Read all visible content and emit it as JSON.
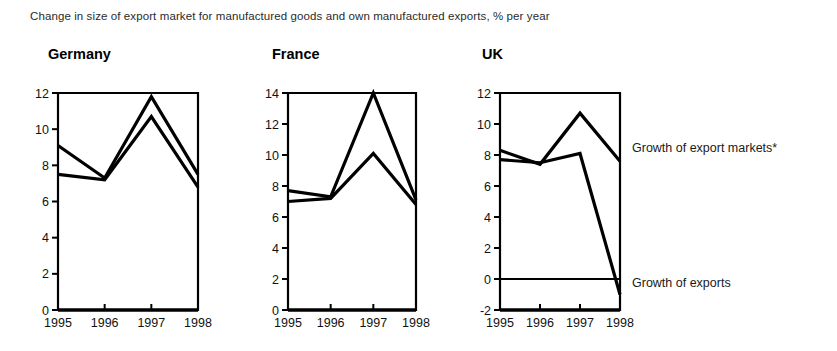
{
  "caption": "Change in size of export market for manufactured goods and own manufactured exports, % per year",
  "legend": {
    "markets": "Growth of export markets*",
    "exports": "Growth of exports"
  },
  "chart_data": [
    {
      "type": "line",
      "title": "Germany",
      "xlabel": "",
      "ylabel": "",
      "x": [
        "1995",
        "1996",
        "1997",
        "1998"
      ],
      "categories": [
        "1995",
        "1996",
        "1997",
        "1998"
      ],
      "ylim": [
        0,
        12
      ],
      "yticks": [
        "0",
        "2",
        "4",
        "6",
        "8",
        "10",
        "12"
      ],
      "ytick_values": [
        0,
        2,
        4,
        6,
        8,
        10,
        12
      ],
      "grid": false,
      "legend_position": "right",
      "series": [
        {
          "name": "Growth of export markets*",
          "values": [
            9.1,
            7.3,
            11.8,
            7.5
          ]
        },
        {
          "name": "Growth of exports",
          "values": [
            7.5,
            7.2,
            10.7,
            6.8
          ]
        }
      ]
    },
    {
      "type": "line",
      "title": "France",
      "xlabel": "",
      "ylabel": "",
      "x": [
        "1995",
        "1996",
        "1997",
        "1998"
      ],
      "categories": [
        "1995",
        "1996",
        "1997",
        "1998"
      ],
      "ylim": [
        0,
        14
      ],
      "yticks": [
        "0",
        "2",
        "4",
        "6",
        "8",
        "10",
        "12",
        "14"
      ],
      "ytick_values": [
        0,
        2,
        4,
        6,
        8,
        10,
        12,
        14
      ],
      "grid": false,
      "legend_position": "right",
      "series": [
        {
          "name": "Growth of export markets*",
          "values": [
            7.7,
            7.3,
            14.0,
            7.1
          ]
        },
        {
          "name": "Growth of exports",
          "values": [
            7.0,
            7.2,
            10.1,
            6.8
          ]
        }
      ]
    },
    {
      "type": "line",
      "title": "UK",
      "xlabel": "",
      "ylabel": "",
      "x": [
        "1995",
        "1996",
        "1997",
        "1998"
      ],
      "categories": [
        "1995",
        "1996",
        "1997",
        "1998"
      ],
      "ylim": [
        -2,
        12
      ],
      "yticks": [
        "-2",
        "0",
        "2",
        "4",
        "6",
        "8",
        "10",
        "12"
      ],
      "ytick_values": [
        -2,
        0,
        2,
        4,
        6,
        8,
        10,
        12
      ],
      "grid": false,
      "zero_line": true,
      "legend_position": "right",
      "series": [
        {
          "name": "Growth of export markets*",
          "values": [
            8.3,
            7.4,
            10.7,
            7.6
          ]
        },
        {
          "name": "Growth of exports",
          "values": [
            7.7,
            7.5,
            8.1,
            -1.0
          ]
        }
      ]
    }
  ]
}
